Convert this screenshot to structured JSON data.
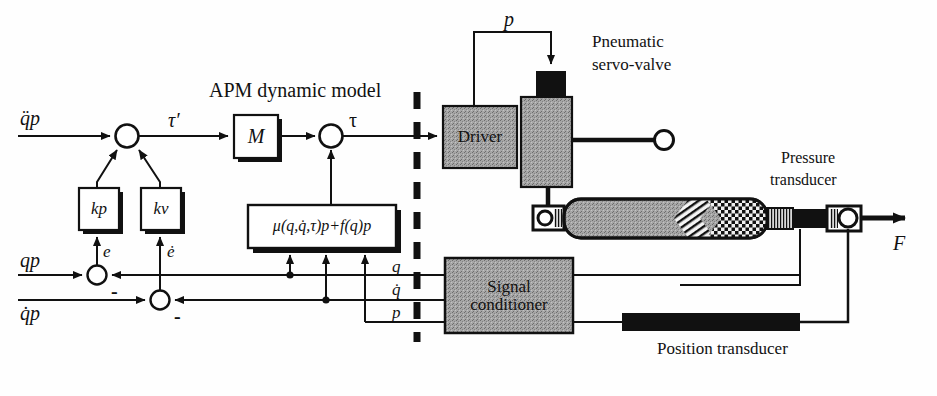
{
  "diagram": {
    "title_left_section": "APM dynamic model",
    "labels": {
      "input_accel": "q̈p",
      "input_pos": "qp",
      "input_vel": "q̇p",
      "tau_prime": "τ′",
      "tau": "τ",
      "error_pos": "e",
      "error_vel": "ė",
      "minus_1": "-",
      "minus_2": "-",
      "pressure_cmd": "p",
      "feedback_q": "q",
      "feedback_qdot": "q̇",
      "feedback_p": "p",
      "force": "F"
    },
    "blocks": {
      "gain_kp": "kp",
      "gain_kv": "kv",
      "inertia": "M",
      "model_equation": "μ(q,q̇,τ)p+f(q)p",
      "driver": "Driver",
      "signal_conditioner_line1": "Signal",
      "signal_conditioner_line2": "conditioner"
    },
    "annotations": {
      "servo_valve_line1": "Pneumatic",
      "servo_valve_line2": "servo-valve",
      "pressure_transducer_line1": "Pressure",
      "pressure_transducer_line2": "transducer",
      "position_transducer": "Position transducer"
    },
    "colors": {
      "stroke": "#111111",
      "gray_fill": "#9a9a9a",
      "black_fill": "#101010",
      "background": "#fefefe"
    }
  }
}
